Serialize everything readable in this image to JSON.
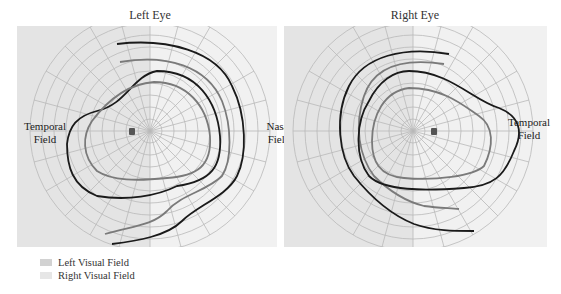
{
  "titles": {
    "left": "Left Eye",
    "right": "Right Eye"
  },
  "field_labels": {
    "left_temporal": [
      "Temporal",
      "Field"
    ],
    "left_nasal": [
      "Nasal",
      "Field"
    ],
    "right_temporal": [
      "Temporal",
      "Field"
    ]
  },
  "legend": [
    {
      "label": "Left Visual Field",
      "color": "#d2d2d2"
    },
    {
      "label": "Right Visual Field",
      "color": "#e6e6e6"
    }
  ],
  "colors": {
    "left_field_shade": "#e4e4e4",
    "right_field_shade": "#f1f1f1",
    "grid": "#b9b9b9",
    "isopter_dark": "#1a1a1a",
    "isopter_gray": "#7a7a7a",
    "blind_spot": "#555555"
  },
  "grid": {
    "rings_deg": [
      10,
      20,
      30,
      40,
      50,
      60,
      70,
      80,
      90
    ],
    "meridian_step_deg": 15
  }
}
